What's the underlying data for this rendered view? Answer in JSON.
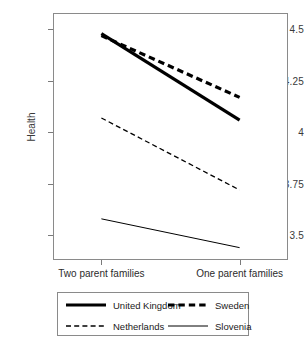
{
  "chart_data": {
    "type": "line",
    "title": "",
    "subtitle": "",
    "xlabel": "",
    "ylabel": "Health",
    "categories": [
      "Two parent families",
      "One parent families"
    ],
    "x": [
      0,
      1
    ],
    "ylim": [
      3.38,
      4.58
    ],
    "xlim": [
      -0.35,
      1.35
    ],
    "grid": false,
    "legend_position": "bottom",
    "ytick_labels": [
      "4.5",
      "4.25",
      "4",
      "3.75",
      "3.5"
    ],
    "ytick_values": [
      4.5,
      4.25,
      4,
      3.75,
      3.5
    ],
    "series": [
      {
        "name": "United Kingdom",
        "values": [
          4.48,
          4.06
        ],
        "style": "solid",
        "width": 3.2,
        "color": "#000000"
      },
      {
        "name": "Sweden",
        "values": [
          4.47,
          4.17
        ],
        "style": "dashed",
        "width": 3.2,
        "color": "#000000"
      },
      {
        "name": "Netherlands",
        "values": [
          4.07,
          3.72
        ],
        "style": "dashed",
        "width": 1.3,
        "color": "#000000"
      },
      {
        "name": "Slovenia",
        "values": [
          3.58,
          3.44
        ],
        "style": "solid",
        "width": 1.0,
        "color": "#000000"
      }
    ]
  },
  "legend": {
    "entries": [
      {
        "label": "United Kingdom",
        "style": "solid",
        "width": 3.2
      },
      {
        "label": "Sweden",
        "style": "dashed",
        "width": 3.2
      },
      {
        "label": "Netherlands",
        "style": "dashed",
        "width": 1.3
      },
      {
        "label": "Slovenia",
        "style": "solid",
        "width": 1.0
      }
    ]
  },
  "colors": {
    "ink": "#000000",
    "axis": "#8a8a8a",
    "tick_text": "#3a3a3a",
    "background": "#ffffff"
  }
}
